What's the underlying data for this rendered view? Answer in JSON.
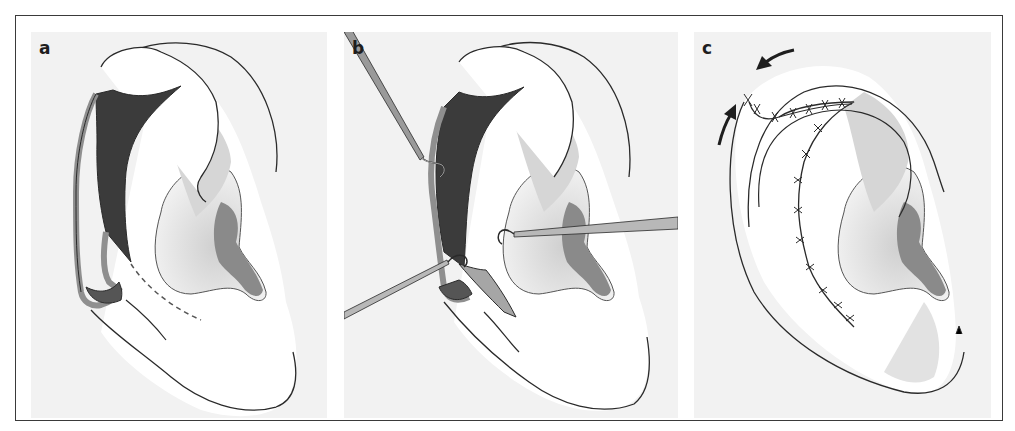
{
  "figure": {
    "panels": [
      {
        "id": "a",
        "label": "a",
        "content": "Ear with posterior helical rim skin flap elevated, dark exposed area, dashed incision line"
      },
      {
        "id": "b",
        "label": "b",
        "content": "Ear with flap retracted by two skin hooks and one forceps-like instrument"
      },
      {
        "id": "c",
        "label": "c",
        "content": "Sutured ear after helical advancement, with two directional arrows"
      }
    ],
    "colors": {
      "background": "#f2f2f2",
      "skin": "#ffffff",
      "shade_light": "#d8d8d8",
      "shade_mid": "#a9a9a9",
      "shade_dark": "#7a7a7a",
      "exposed_tissue": "#3b3b3b",
      "outline": "#2a2a2a"
    }
  }
}
